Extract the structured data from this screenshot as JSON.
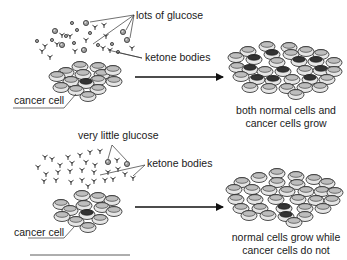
{
  "panels": [
    {
      "id": "high-glucose",
      "labels": {
        "glucose": "lots of glucose",
        "ketone": "ketone bodies",
        "cancer_cell": "cancer cell"
      },
      "result_caption": [
        "both normal cells and",
        "cancer cells grow"
      ]
    },
    {
      "id": "low-glucose",
      "labels": {
        "glucose": "very little glucose",
        "ketone": "ketone bodies",
        "cancer_cell": "cancer cell"
      },
      "result_caption": [
        "normal cells grow while",
        "cancer cells do not"
      ]
    }
  ],
  "colors": {
    "line": "#111111",
    "glucose_fill": "#9a9a9a",
    "cell_fill": "#e6e6e6"
  }
}
